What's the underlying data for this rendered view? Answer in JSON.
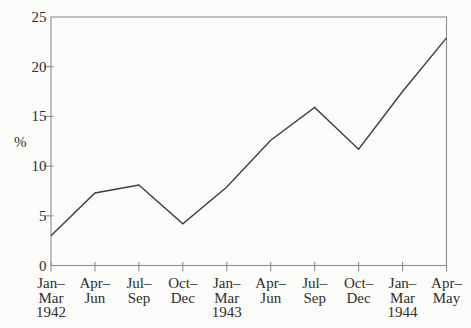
{
  "chart_data": {
    "type": "line",
    "ylabel": "%",
    "ylim": [
      0,
      25
    ],
    "yticks": [
      0,
      5,
      10,
      15,
      20,
      25
    ],
    "categories": [
      [
        "Jan–",
        "Mar",
        "1942"
      ],
      [
        "Apr–",
        "Jun"
      ],
      [
        "Jul–",
        "Sep"
      ],
      [
        "Oct–",
        "Dec"
      ],
      [
        "Jan–",
        "Mar",
        "1943"
      ],
      [
        "Apr–",
        "Jun"
      ],
      [
        "Jul–",
        "Sep"
      ],
      [
        "Oct–",
        "Dec"
      ],
      [
        "Jan–",
        "Mar",
        "1944"
      ],
      [
        "Apr–",
        "May"
      ]
    ],
    "values": [
      3.0,
      7.3,
      8.1,
      4.2,
      7.9,
      12.6,
      15.9,
      11.7,
      17.5,
      22.9
    ],
    "grid": false,
    "legend": "none",
    "frame": "box",
    "colors": {
      "line": "#3d3d3d",
      "frame": "#8f8f8c",
      "text": "#2e2e2e",
      "background": "#fbfbf9"
    }
  }
}
